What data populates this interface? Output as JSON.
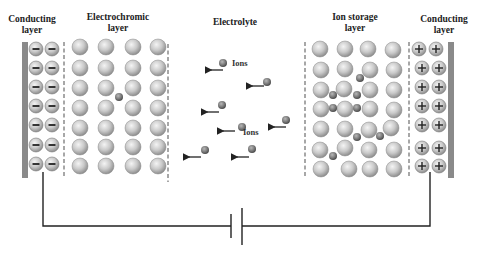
{
  "labels": {
    "conducting_left": "Conducting\nlayer",
    "electrochromic": "Electrochromic\nlayer",
    "electrolyte": "Electrolyte",
    "ion_storage": "Ion storage\nlayer",
    "conducting_right": "Conducting\nlayer",
    "ions_1": "Ions",
    "ions_2": "Ions"
  },
  "symbols": {
    "negative": "−",
    "positive": "+"
  },
  "colors": {
    "bar": "#8a8a8a",
    "dash": "#8a8a8a",
    "ball_light": "#e6e6e6",
    "ball_dark": "#8e8e8e",
    "ion_light": "#b0b0b0",
    "ion_dark": "#555555",
    "wire": "#222222"
  },
  "layers": {
    "conducting_left": {
      "charge": "negative",
      "rows": 7,
      "cols": 2
    },
    "electrochromic": {
      "rows": 7,
      "cols": 4
    },
    "ion_storage": {
      "rows": 7,
      "cols": 4
    },
    "conducting_right": {
      "charge": "positive",
      "rows": 7,
      "cols": 2
    }
  },
  "circuit": {
    "element": "battery"
  }
}
